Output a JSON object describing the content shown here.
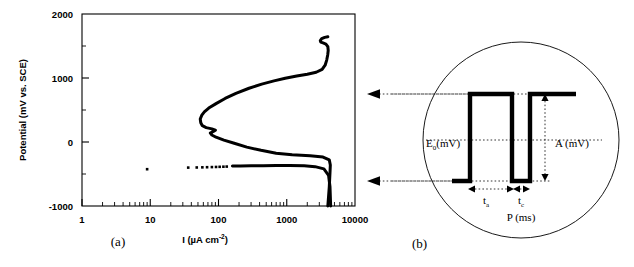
{
  "figure": {
    "panels": [
      {
        "id": "a",
        "label": "(a)"
      },
      {
        "id": "b",
        "label": "(b)"
      }
    ]
  },
  "chart_data": {
    "type": "line",
    "title": "",
    "xlabel": "I (µA cm",
    "xlabel_sup": "-2",
    "xlabel_tail": ")",
    "ylabel": "Potential (mV vs. SCE)",
    "xscale": "log",
    "yscale": "linear",
    "xlim": [
      1,
      10000
    ],
    "ylim": [
      -1000,
      2000
    ],
    "grid": false,
    "legend": "none",
    "xticks": [
      "1",
      "10",
      "100",
      "1000",
      "10000"
    ],
    "xtick_values": [
      1,
      10,
      100,
      1000,
      10000
    ],
    "yticks": [
      "2000",
      "1000",
      "0",
      "-1000"
    ],
    "ytick_values": [
      2000,
      1000,
      0,
      -1000
    ],
    "series": [
      {
        "name": "anodic-polarization-curve",
        "style": "solid-thick",
        "color": "#000000",
        "points": [
          [
            4000,
            -1000
          ],
          [
            4200,
            -700
          ],
          [
            4300,
            -480
          ],
          [
            4350,
            -360
          ],
          [
            4200,
            -280
          ],
          [
            3400,
            -235
          ],
          [
            2200,
            -215
          ],
          [
            1200,
            -200
          ],
          [
            700,
            -175
          ],
          [
            420,
            -130
          ],
          [
            260,
            -80
          ],
          [
            170,
            -20
          ],
          [
            120,
            30
          ],
          [
            92,
            75
          ],
          [
            80,
            110
          ],
          [
            76,
            140
          ],
          [
            84,
            165
          ],
          [
            90,
            185
          ],
          [
            80,
            205
          ],
          [
            66,
            225
          ],
          [
            58,
            255
          ],
          [
            55,
            300
          ],
          [
            54,
            360
          ],
          [
            57,
            420
          ],
          [
            62,
            470
          ],
          [
            72,
            530
          ],
          [
            92,
            600
          ],
          [
            125,
            680
          ],
          [
            180,
            760
          ],
          [
            280,
            840
          ],
          [
            430,
            905
          ],
          [
            650,
            955
          ],
          [
            950,
            995
          ],
          [
            1400,
            1030
          ],
          [
            2000,
            1060
          ],
          [
            2700,
            1090
          ],
          [
            3300,
            1135
          ],
          [
            3650,
            1200
          ],
          [
            3850,
            1280
          ],
          [
            3980,
            1360
          ],
          [
            4050,
            1430
          ],
          [
            4000,
            1490
          ],
          [
            3750,
            1530
          ],
          [
            3400,
            1548
          ],
          [
            3150,
            1560
          ],
          [
            3100,
            1585
          ],
          [
            3250,
            1615
          ],
          [
            3600,
            1635
          ],
          [
            4000,
            1645
          ]
        ]
      },
      {
        "name": "cathodic-branch",
        "style": "solid-thick",
        "color": "#000000",
        "points": [
          [
            4400,
            -1000
          ],
          [
            4300,
            -700
          ],
          [
            4100,
            -520
          ],
          [
            3500,
            -420
          ],
          [
            2600,
            -385
          ],
          [
            1800,
            -372
          ],
          [
            1100,
            -368
          ],
          [
            700,
            -368
          ],
          [
            450,
            -370
          ],
          [
            300,
            -372
          ],
          [
            210,
            -374
          ],
          [
            160,
            -376
          ]
        ]
      }
    ],
    "scatter": [
      {
        "name": "cathodic-data-points",
        "color": "#000000",
        "points": [
          [
            9,
            -425
          ],
          [
            36,
            -400
          ],
          [
            48,
            -398
          ],
          [
            58,
            -396
          ],
          [
            68,
            -394
          ],
          [
            80,
            -392
          ],
          [
            92,
            -390
          ],
          [
            104,
            -388
          ],
          [
            118,
            -386
          ],
          [
            132,
            -384
          ]
        ]
      }
    ]
  },
  "waveform": {
    "name": "pulse-waveform-diagram",
    "labels": {
      "baseline_potential": "E",
      "baseline_potential_sub": "0",
      "baseline_potential_unit": "(mV)",
      "amplitude": "A (mV)",
      "on_time": "t",
      "on_time_sub": "a",
      "off_time": "t",
      "off_time_sub": "c",
      "period": "P (ms)"
    }
  },
  "connectors": [
    {
      "name": "connector-upper",
      "target": "passive-region",
      "direction": "left"
    },
    {
      "name": "connector-lower",
      "target": "cathodic-region",
      "direction": "left"
    }
  ]
}
